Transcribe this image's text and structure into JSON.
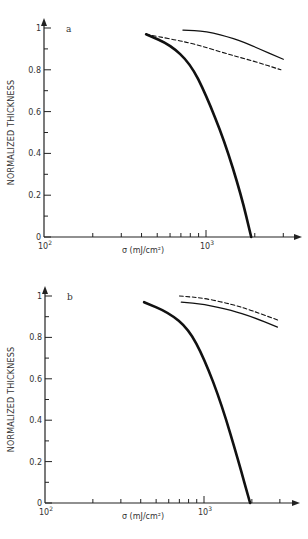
{
  "chart_data": [
    {
      "type": "line",
      "panel_label": "a",
      "title": "",
      "xlabel": "σ (mJ/cm²)",
      "ylabel": "NORMALIZED THICKNESS",
      "xscale": "log",
      "xlim": [
        100,
        4200
      ],
      "ylim": [
        0,
        1
      ],
      "x_tick_labels": [
        "10²",
        "10³"
      ],
      "y_tick_labels": [
        "0",
        "0.2",
        "0.4",
        "0.6",
        "0.8",
        "1"
      ],
      "grid": false,
      "legend": null,
      "series": [
        {
          "name": "thick solid",
          "style": "solid-thick",
          "x": [
            427,
            600,
            800,
            1000,
            1300,
            1650,
            1900
          ],
          "y": [
            0.97,
            0.92,
            0.83,
            0.68,
            0.46,
            0.2,
            0.0
          ]
        },
        {
          "name": "dashed",
          "style": "dashed",
          "x": [
            427,
            800,
            1300,
            2000,
            2900
          ],
          "y": [
            0.97,
            0.93,
            0.88,
            0.84,
            0.8
          ]
        },
        {
          "name": "thin solid",
          "style": "solid-thin",
          "x": [
            720,
            1000,
            1500,
            2000,
            3000
          ],
          "y": [
            0.99,
            0.985,
            0.95,
            0.91,
            0.85
          ]
        }
      ]
    },
    {
      "type": "line",
      "panel_label": "b",
      "title": "",
      "xlabel": "σ (mJ/cm²)",
      "ylabel": "NORMALIZED THICKNESS",
      "xscale": "log",
      "xlim": [
        100,
        4200
      ],
      "ylim": [
        0,
        1
      ],
      "x_tick_labels": [
        "10²",
        "10³"
      ],
      "y_tick_labels": [
        "0",
        "0.2",
        "0.4",
        "0.6",
        "0.8",
        "1"
      ],
      "grid": false,
      "legend": null,
      "series": [
        {
          "name": "thick solid",
          "style": "solid-thick",
          "x": [
            420,
            600,
            800,
            1000,
            1300,
            1650,
            1950
          ],
          "y": [
            0.97,
            0.92,
            0.84,
            0.7,
            0.47,
            0.2,
            0.0
          ]
        },
        {
          "name": "dashed",
          "style": "dashed",
          "x": [
            700,
            1000,
            1500,
            2000,
            3000
          ],
          "y": [
            1.0,
            0.99,
            0.96,
            0.93,
            0.88
          ]
        },
        {
          "name": "thin solid",
          "style": "solid-thin",
          "x": [
            720,
            1000,
            1500,
            2000,
            2900
          ],
          "y": [
            0.97,
            0.96,
            0.93,
            0.9,
            0.85
          ]
        }
      ]
    }
  ],
  "layout": {
    "panels": [
      {
        "x0": 44,
        "decade_px": 162,
        "y0": 237,
        "y1": 28,
        "x_end": 302
      },
      {
        "x0": 45,
        "decade_px": 159,
        "y0": 503,
        "y1": 296,
        "x_end": 300
      }
    ]
  }
}
